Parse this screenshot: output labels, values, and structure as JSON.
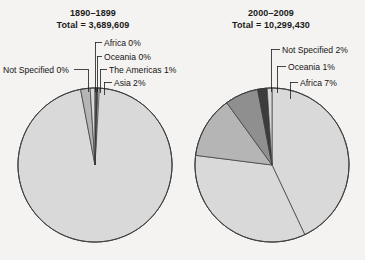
{
  "chart_data": [
    {
      "type": "pie",
      "title": "1890–1899",
      "subtitle": "Total = 3,689,609",
      "total": "3,689,609",
      "period": "1890–1899",
      "categories": [
        "Europe",
        "Asia",
        "The Americas",
        "Oceania",
        "Africa",
        "Not Specified"
      ],
      "values": [
        97,
        2,
        1,
        0,
        0,
        0
      ],
      "labels": [
        "Europe 97%",
        "Asia 2%",
        "The Americas 1%",
        "Oceania 0%",
        "Africa 0%",
        "Not Specified 0%"
      ],
      "colors": [
        "#d9d9d9",
        "#b5b5b5",
        "#d9d9d9",
        "#7a7a7a",
        "#3c3c3c",
        "#d9d9d9"
      ],
      "legend": "none",
      "grid": false
    },
    {
      "type": "pie",
      "title": "2000–2009",
      "subtitle": "Total = 10,299,430",
      "total": "10,299,430",
      "period": "2000–2009",
      "categories": [
        "The Americas",
        "Asia",
        "Europe",
        "Africa",
        "Not Specified",
        "Oceania"
      ],
      "values": [
        43,
        34,
        13,
        7,
        2,
        1
      ],
      "labels": [
        "The Americas 43%",
        "Asia 34%",
        "Europe 13%",
        "Africa 7%",
        "Not Specified 2%",
        "Oceania 1%"
      ],
      "colors": [
        "#d9d9d9",
        "#d9d9d9",
        "#b5b5b5",
        "#8f8f8f",
        "#3c3c3c",
        "#d9d9d9"
      ],
      "legend": "none",
      "grid": false
    }
  ],
  "panels": {
    "left": {
      "period": "1890–1899",
      "total_line": "Total = 3,689,609",
      "callouts": {
        "africa": "Africa 0%",
        "oceania": "Oceania 0%",
        "americas": "The Americas 1%",
        "asia": "Asia 2%",
        "not_specified": "Not Specified 0%"
      },
      "slice_labels": {
        "europe_name": "Europe 97%"
      }
    },
    "right": {
      "period": "2000–2009",
      "total_line": "Total = 10,299,430",
      "callouts": {
        "not_specified": "Not Specified 2%",
        "oceania": "Oceania 1%",
        "africa": "Africa 7%"
      },
      "slice_labels": {
        "europe_name": "Europe",
        "europe_pct": "13%",
        "asia": "Asia 34%",
        "americas_name": "The Americas",
        "americas_pct": "43%"
      }
    }
  },
  "style": {
    "background": "#f4f3f1",
    "slice_light": "#d9d9d9",
    "slice_medium": "#b5b5b5",
    "slice_dark_gray": "#8f8f8f",
    "slice_darkest": "#3c3c3c",
    "outline": "#3a3a3a"
  }
}
